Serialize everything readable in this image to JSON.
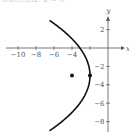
{
  "header": {
    "cut_text": "Directrix: x = 0"
  },
  "chart_data": {
    "type": "line",
    "title": "",
    "xlabel": "x",
    "ylabel": "y",
    "xlim": [
      -11,
      1.5
    ],
    "ylim": [
      -9,
      4
    ],
    "grid": false,
    "x_ticks": [
      -10,
      -8,
      -6,
      -4,
      -2
    ],
    "x_tick_labels": [
      "-10",
      "-8",
      "-6",
      "-4",
      ""
    ],
    "y_ticks": [
      2,
      -2,
      -4,
      -6,
      -8
    ],
    "y_tick_labels": [
      "2",
      "-2",
      "-4",
      "-6",
      "-8"
    ],
    "series": [
      {
        "name": "parabola",
        "equation": "(y+3)^2 = -8(x+2)",
        "vertex": [
          -2,
          -3
        ],
        "x": [
          -6.5,
          -5.1,
          -3.9,
          -2.8,
          -2.2,
          -2,
          -2.2,
          -2.8,
          -3.9,
          -5.1,
          -6.5
        ],
        "y": [
          3,
          2,
          1,
          0,
          -1.7,
          -3,
          -4.3,
          -6,
          -7,
          -8,
          -9
        ]
      }
    ],
    "points": [
      {
        "label": "focus",
        "x": -4,
        "y": -3
      },
      {
        "label": "vertex",
        "x": -2,
        "y": -3
      }
    ],
    "colors": {
      "axis": "#555555",
      "curve": "#111111",
      "points": "#111111"
    }
  }
}
